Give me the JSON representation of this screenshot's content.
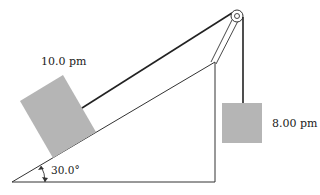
{
  "diagram": {
    "incline_block_label": "10.0 pm",
    "hanging_block_label": "8.00 pm",
    "angle_label": "30.0°",
    "colors": {
      "block_fill": "#b5b5b5",
      "line": "#222222"
    }
  }
}
